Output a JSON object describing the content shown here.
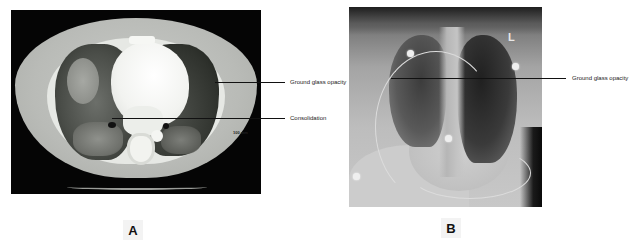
{
  "figure": {
    "panels": [
      {
        "id": "A",
        "label": "A",
        "modality": "axial chest CT",
        "scale_text": "100 mm",
        "annotations": [
          {
            "text": "Ground glass opacity"
          },
          {
            "text": "Consolidation"
          }
        ]
      },
      {
        "id": "B",
        "label": "B",
        "modality": "chest X-ray",
        "side_marker": "L",
        "annotations": [
          {
            "text": "Ground glass opacity"
          }
        ]
      }
    ]
  },
  "colors": {
    "background": "#ffffff",
    "ct_background": "#050505",
    "leader_line": "#111111",
    "label_box": "#f3f3f3"
  }
}
